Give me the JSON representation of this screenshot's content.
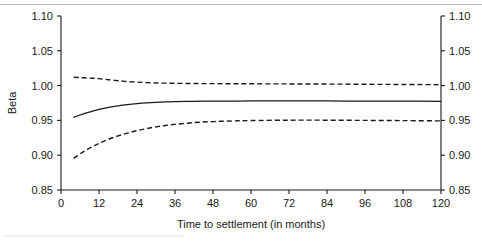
{
  "chart_data": {
    "type": "line",
    "title": "",
    "xlabel": "Time to settlement (in months)",
    "ylabel": "Beta",
    "xlim": [
      0,
      120
    ],
    "ylim": [
      0.85,
      1.1
    ],
    "grid": false,
    "legend": null,
    "x_ticks": [
      "0",
      "12",
      "24",
      "36",
      "48",
      "60",
      "72",
      "84",
      "96",
      "108",
      "120"
    ],
    "x_tick_values": [
      0,
      12,
      24,
      36,
      48,
      60,
      72,
      84,
      96,
      108,
      120
    ],
    "y_ticks": [
      "0.85",
      "0.90",
      "0.95",
      "1.00",
      "1.05",
      "1.10"
    ],
    "y_tick_values": [
      0.85,
      0.9,
      0.95,
      1.0,
      1.05,
      1.1
    ],
    "y_ticks_right": [
      "0.85",
      "0.90",
      "0.95",
      "1.00",
      "1.05",
      "1.10"
    ],
    "x": [
      4,
      6,
      8,
      10,
      12,
      15,
      18,
      21,
      24,
      27,
      30,
      33,
      36,
      42,
      48,
      54,
      60,
      72,
      84,
      96,
      108,
      120
    ],
    "series": [
      {
        "name": "Upper confidence bound",
        "style": "dashed",
        "color": "#1a1a1a",
        "values": [
          1.012,
          1.0115,
          1.011,
          1.0105,
          1.01,
          1.0085,
          1.007,
          1.0058,
          1.005,
          1.0043,
          1.0038,
          1.0035,
          1.0033,
          1.003,
          1.0028,
          1.0027,
          1.0026,
          1.0024,
          1.0022,
          1.0019,
          1.0016,
          1.0013
        ]
      },
      {
        "name": "Beta estimate",
        "style": "solid",
        "color": "#1a1a1a",
        "values": [
          0.9545,
          0.9578,
          0.9608,
          0.9634,
          0.9657,
          0.9686,
          0.9709,
          0.9727,
          0.9741,
          0.9752,
          0.976,
          0.9766,
          0.977,
          0.9775,
          0.9777,
          0.9778,
          0.9779,
          0.9779,
          0.9779,
          0.9778,
          0.9777,
          0.9775
        ]
      },
      {
        "name": "Lower confidence bound",
        "style": "dashed",
        "color": "#1a1a1a",
        "values": [
          0.8955,
          0.9018,
          0.9075,
          0.9125,
          0.917,
          0.9228,
          0.9277,
          0.9318,
          0.9353,
          0.9382,
          0.9407,
          0.9427,
          0.9443,
          0.9468,
          0.9483,
          0.9492,
          0.9498,
          0.9503,
          0.9503,
          0.95,
          0.9497,
          0.9493
        ]
      }
    ]
  }
}
